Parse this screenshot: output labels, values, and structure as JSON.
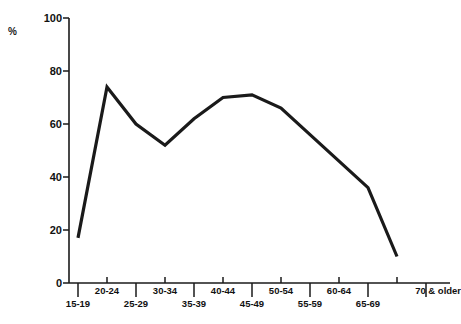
{
  "chart_data": {
    "type": "line",
    "title": "",
    "xlabel": "",
    "ylabel": "%",
    "ylim": [
      0,
      100
    ],
    "yticks": [
      0,
      20,
      40,
      60,
      80,
      100
    ],
    "grid": false,
    "legend": "none",
    "categories": [
      "15-19",
      "20-24",
      "25-29",
      "30-34",
      "35-39",
      "40-44",
      "45-49",
      "50-54",
      "55-59",
      "60-64",
      "65-69",
      "70 & older"
    ],
    "x": [
      "15-19",
      "20-24",
      "25-29",
      "30-34",
      "35-39",
      "40-44",
      "45-49",
      "50-54",
      "55-59",
      "60-64",
      "65-69",
      "70 & older"
    ],
    "values": [
      17,
      74,
      60,
      52,
      62,
      70,
      71,
      66,
      56,
      46,
      36,
      10
    ],
    "series": [
      {
        "name": "",
        "values": [
          17,
          74,
          60,
          52,
          62,
          70,
          71,
          66,
          56,
          46,
          36,
          10
        ]
      }
    ],
    "line_color": "#1a1a1a",
    "line_width": 3.2
  },
  "axes": {
    "y_axis_label": "%",
    "y_tick_labels": [
      "100",
      "80",
      "60",
      "40",
      "20",
      "0"
    ],
    "x_tick_labels_upper": [
      "20-24",
      "30-34",
      "40-44",
      "50-54",
      "60-64",
      "70 & older"
    ],
    "x_tick_labels_lower": [
      "15-19",
      "25-29",
      "35-39",
      "45-49",
      "55-59",
      "65-69"
    ]
  },
  "caption": {
    "ghost_text": ""
  }
}
